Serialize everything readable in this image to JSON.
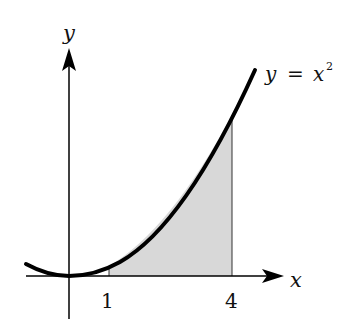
{
  "diagram": {
    "function_label": {
      "lhs": "y",
      "eq": "=",
      "base": "x",
      "exp": "2"
    },
    "axes": {
      "x_label": "x",
      "y_label": "y"
    },
    "ticks": [
      {
        "value": 1,
        "label": "1"
      },
      {
        "value": 4,
        "label": "4"
      }
    ],
    "shaded_region": {
      "from": 1,
      "to": 4,
      "fill": "#d8d8d8"
    },
    "colors": {
      "curve": "#000000",
      "axis": "#000000",
      "shade": "#d8d8d8"
    }
  }
}
